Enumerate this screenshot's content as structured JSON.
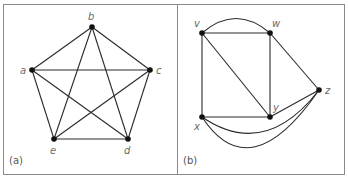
{
  "panels": [
    {
      "id": "a",
      "label": "(a)",
      "nodes": [
        {
          "id": "a",
          "label": "a",
          "x": 32,
          "y": 70,
          "lx": 20,
          "ly": 74
        },
        {
          "id": "b",
          "label": "b",
          "x": 92,
          "y": 27,
          "lx": 88,
          "ly": 20
        },
        {
          "id": "c",
          "label": "c",
          "x": 150,
          "y": 70,
          "lx": 156,
          "ly": 74
        },
        {
          "id": "d",
          "label": "d",
          "x": 128,
          "y": 139,
          "lx": 124,
          "ly": 154
        },
        {
          "id": "e",
          "label": "e",
          "x": 54,
          "y": 139,
          "lx": 50,
          "ly": 154
        }
      ],
      "edges": [
        {
          "from": "a",
          "to": "b"
        },
        {
          "from": "a",
          "to": "c"
        },
        {
          "from": "a",
          "to": "d"
        },
        {
          "from": "a",
          "to": "e"
        },
        {
          "from": "b",
          "to": "c"
        },
        {
          "from": "b",
          "to": "d"
        },
        {
          "from": "b",
          "to": "e"
        },
        {
          "from": "c",
          "to": "d"
        },
        {
          "from": "c",
          "to": "e"
        },
        {
          "from": "d",
          "to": "e"
        }
      ]
    },
    {
      "id": "b",
      "label": "(b)",
      "nodes": [
        {
          "id": "v",
          "label": "v",
          "x": 202,
          "y": 33,
          "lx": 194,
          "ly": 27
        },
        {
          "id": "w",
          "label": "w",
          "x": 270,
          "y": 33,
          "lx": 272,
          "ly": 27
        },
        {
          "id": "z",
          "label": "z",
          "x": 319,
          "y": 90,
          "lx": 325,
          "ly": 94
        },
        {
          "id": "y",
          "label": "y",
          "x": 270,
          "y": 117,
          "lx": 273,
          "ly": 111
        },
        {
          "id": "x",
          "label": "x",
          "x": 202,
          "y": 117,
          "lx": 194,
          "ly": 130
        }
      ],
      "edges": [
        {
          "from": "v",
          "to": "w",
          "curve": null
        },
        {
          "from": "v",
          "to": "w",
          "curve": {
            "cx": 236,
            "cy": 4
          }
        },
        {
          "from": "v",
          "to": "x",
          "curve": null
        },
        {
          "from": "v",
          "to": "y",
          "curve": null
        },
        {
          "from": "w",
          "to": "y",
          "curve": null
        },
        {
          "from": "w",
          "to": "z",
          "curve": null
        },
        {
          "from": "x",
          "to": "y",
          "curve": null
        },
        {
          "from": "y",
          "to": "z",
          "curve": null
        },
        {
          "from": "x",
          "to": "z",
          "curve": {
            "cx": 265,
            "cy": 160
          }
        },
        {
          "from": "x",
          "to": "z",
          "curve": {
            "cx": 250,
            "cy": 190
          }
        }
      ]
    }
  ],
  "colors": {
    "stroke": "#2a2a2a",
    "node": "#111111",
    "border": "#8a8a8a"
  }
}
